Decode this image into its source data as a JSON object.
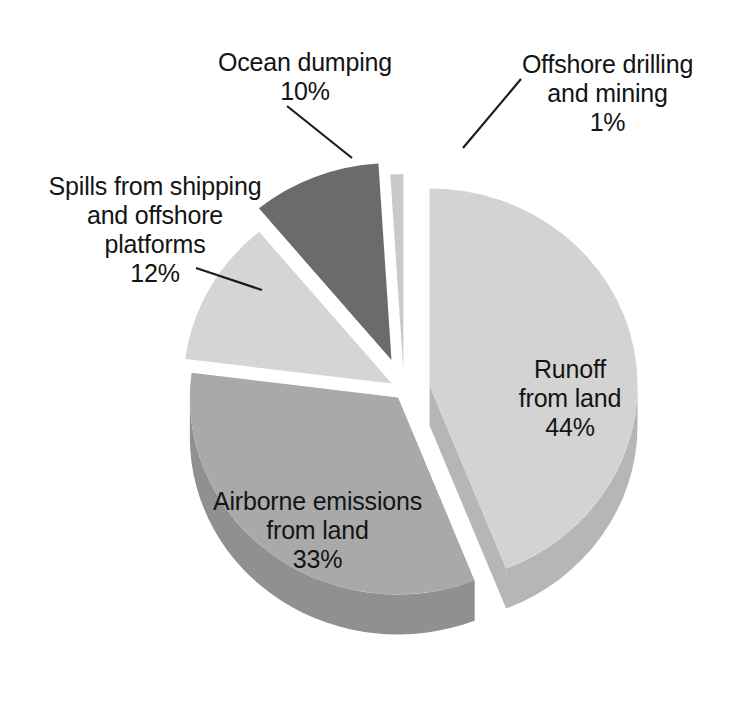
{
  "chart_data": {
    "type": "pie",
    "title": "",
    "subtitle": "",
    "xlabel": "",
    "ylabel": "",
    "legend_position": "none",
    "grid": false,
    "exploded": true,
    "three_d": true,
    "units": "percent",
    "categories": [
      "Runoff from land",
      "Airborne emissions from land",
      "Spills from shipping and offshore platforms",
      "Ocean dumping",
      "Offshore drilling and mining"
    ],
    "values": [
      44,
      33,
      12,
      10,
      1
    ],
    "slices": [
      {
        "name": "Runoff from land",
        "value": 44,
        "value_label": "44%",
        "label_lines": [
          "Runoff",
          "from land",
          "44%"
        ],
        "label_placement": "inside",
        "color": "#d3d3d3",
        "side_color": "#b6b6b6"
      },
      {
        "name": "Airborne emissions from land",
        "value": 33,
        "value_label": "33%",
        "label_lines": [
          "Airborne emissions",
          "from land",
          "33%"
        ],
        "label_placement": "inside",
        "color": "#a9a9a9",
        "side_color": "#909090"
      },
      {
        "name": "Spills from shipping and offshore platforms",
        "value": 12,
        "value_label": "12%",
        "label_lines": [
          "Spills from shipping",
          "and offshore",
          "platforms",
          "12%"
        ],
        "label_placement": "callout",
        "color": "#d5d5d5",
        "side_color": "#b8b8b8"
      },
      {
        "name": "Ocean dumping",
        "value": 10,
        "value_label": "10%",
        "label_lines": [
          "Ocean dumping",
          "10%"
        ],
        "label_placement": "callout",
        "color": "#6b6b6b",
        "side_color": "#3b3b3b"
      },
      {
        "name": "Offshore drilling and mining",
        "value": 1,
        "value_label": "1%",
        "label_lines": [
          "Offshore drilling",
          "and mining",
          "1%"
        ],
        "label_placement": "callout",
        "color": "#c9c9c9",
        "side_color": "#ababab"
      }
    ]
  },
  "labels": {
    "ocean_dumping": {
      "line1": "Ocean dumping",
      "line2": "10%"
    },
    "offshore_drilling": {
      "line1": "Offshore drilling",
      "line2": "and mining",
      "line3": "1%"
    },
    "spills": {
      "line1": "Spills from shipping",
      "line2": "and offshore",
      "line3": "platforms",
      "line4": "12%"
    },
    "runoff": {
      "line1": "Runoff",
      "line2": "from land",
      "line3": "44%"
    },
    "airborne": {
      "line1": "Airborne emissions",
      "line2": "from land",
      "line3": "33%"
    }
  },
  "colors": {
    "background": "#ffffff",
    "text": "#141414",
    "leader_line": "#1c1c1c",
    "runoff_top": "#d3d3d3",
    "runoff_side": "#b6b6b6",
    "airborne_top": "#a9a9a9",
    "airborne_side": "#909090",
    "spills_top": "#d5d5d5",
    "spills_side": "#b8b8b8",
    "ocean_dumping_top": "#6b6b6b",
    "ocean_dumping_side": "#3b3b3b",
    "offshore_top": "#c9c9c9",
    "offshore_side": "#ababab"
  }
}
